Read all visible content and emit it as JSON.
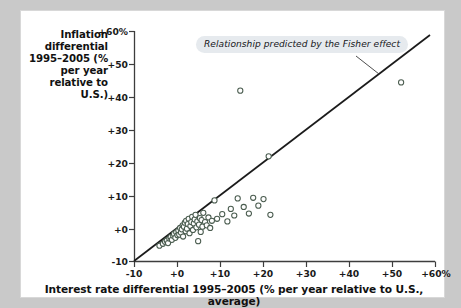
{
  "figure": {
    "y_axis_title": "Inflation differential 1995–2005 (% per year relative to U.S.)",
    "x_axis_title": "Interest rate differential 1995–2005 (% per year relative to U.S., average)",
    "annotation": "Relationship predicted by the Fisher effect"
  },
  "chart_data": {
    "type": "scatter",
    "title": "",
    "xlabel": "Interest rate differential 1995–2005 (% per year relative to U.S., average)",
    "ylabel": "Inflation differential 1995–2005 (% per year relative to U.S.)",
    "xlim": [
      -10,
      60
    ],
    "ylim": [
      -10,
      60
    ],
    "xticks": [
      -10,
      0,
      10,
      20,
      30,
      40,
      50,
      60
    ],
    "yticks": [
      -10,
      0,
      10,
      20,
      30,
      40,
      50,
      60
    ],
    "xtick_labels": [
      "-10",
      "+0",
      "+10",
      "+20",
      "+30",
      "+40",
      "+50",
      "+60%"
    ],
    "ytick_labels": [
      "-10",
      "+0",
      "+10",
      "+20",
      "+30",
      "+40",
      "+50",
      "+60%"
    ],
    "grid": false,
    "legend": null,
    "marker": {
      "style": "open-circle",
      "edge_color": "#4a5c4f",
      "face_color": "#ffffff",
      "radius": 2.6
    },
    "annotations": [
      {
        "text": "Relationship predicted by the Fisher effect",
        "type": "callout",
        "points_to": "45-degree reference line"
      }
    ],
    "reference_line": {
      "label": "Relationship predicted by the Fisher effect",
      "type": "45-degree line",
      "slope": 1,
      "intercept": 0,
      "from": [
        -10,
        -10
      ],
      "to": [
        59,
        59
      ],
      "color": "#1b1b1b"
    },
    "series": [
      {
        "name": "Countries",
        "points": [
          [
            -4.2,
            -5.2
          ],
          [
            -3.4,
            -4.6
          ],
          [
            -2.9,
            -4.0
          ],
          [
            -2.5,
            -3.6
          ],
          [
            -2.2,
            -4.4
          ],
          [
            -1.9,
            -3.0
          ],
          [
            -1.6,
            -2.6
          ],
          [
            -1.3,
            -3.4
          ],
          [
            -1.0,
            -2.2
          ],
          [
            -0.8,
            -1.6
          ],
          [
            -0.5,
            -2.8
          ],
          [
            -0.3,
            -1.1
          ],
          [
            0.0,
            -2.0
          ],
          [
            0.2,
            -0.6
          ],
          [
            0.4,
            -1.8
          ],
          [
            0.6,
            0.2
          ],
          [
            0.8,
            -1.2
          ],
          [
            1.0,
            -0.2
          ],
          [
            1.2,
            1.0
          ],
          [
            1.3,
            -2.4
          ],
          [
            1.5,
            0.6
          ],
          [
            1.7,
            1.8
          ],
          [
            1.9,
            -0.8
          ],
          [
            2.0,
            2.4
          ],
          [
            2.2,
            0.0
          ],
          [
            2.4,
            1.4
          ],
          [
            2.6,
            3.0
          ],
          [
            2.8,
            -1.4
          ],
          [
            3.0,
            0.8
          ],
          [
            3.2,
            2.0
          ],
          [
            3.4,
            3.6
          ],
          [
            3.6,
            -0.4
          ],
          [
            3.8,
            1.6
          ],
          [
            4.0,
            2.8
          ],
          [
            4.2,
            4.2
          ],
          [
            4.4,
            0.4
          ],
          [
            4.6,
            2.2
          ],
          [
            4.8,
            -3.8
          ],
          [
            5.0,
            1.2
          ],
          [
            5.2,
            3.2
          ],
          [
            5.4,
            -1.0
          ],
          [
            5.6,
            2.6
          ],
          [
            5.8,
            0.6
          ],
          [
            6.0,
            4.8
          ],
          [
            6.4,
            2.0
          ],
          [
            6.8,
            1.0
          ],
          [
            7.2,
            3.4
          ],
          [
            7.6,
            0.2
          ],
          [
            8.0,
            2.4
          ],
          [
            8.6,
            8.6
          ],
          [
            9.2,
            3.0
          ],
          [
            10.4,
            4.4
          ],
          [
            11.6,
            2.2
          ],
          [
            12.4,
            6.0
          ],
          [
            13.2,
            4.0
          ],
          [
            14.0,
            9.2
          ],
          [
            14.6,
            42.0
          ],
          [
            15.4,
            6.6
          ],
          [
            16.6,
            4.6
          ],
          [
            17.6,
            9.4
          ],
          [
            18.8,
            7.0
          ],
          [
            20.0,
            9.0
          ],
          [
            21.2,
            22.0
          ],
          [
            21.6,
            4.2
          ],
          [
            52.0,
            44.5
          ]
        ]
      }
    ]
  }
}
